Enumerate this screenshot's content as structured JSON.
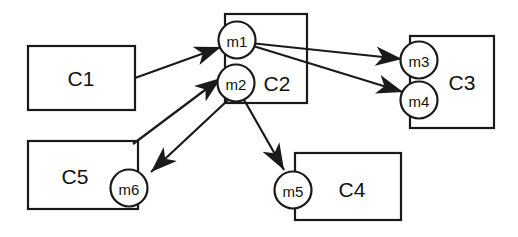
{
  "diagram": {
    "canvas": {
      "width": 518,
      "height": 237,
      "background": "#ffffff"
    },
    "style": {
      "line_color": "#1a1a1a",
      "fill_color": "#ffffff",
      "text_color": "#111111"
    },
    "components": [
      {
        "id": "C1",
        "label": "C1",
        "x": 28,
        "y": 46,
        "width": 107,
        "height": 64,
        "label_x": 81,
        "label_y": 78
      },
      {
        "id": "C2",
        "label": "C2",
        "x": 225,
        "y": 14,
        "width": 82,
        "height": 89,
        "label_x": 277,
        "label_y": 83
      },
      {
        "id": "C3",
        "label": "C3",
        "x": 410,
        "y": 36,
        "width": 84,
        "height": 92,
        "label_x": 462,
        "label_y": 82
      },
      {
        "id": "C4",
        "label": "C4",
        "x": 295,
        "y": 153,
        "width": 106,
        "height": 67,
        "label_x": 352,
        "label_y": 189
      },
      {
        "id": "C5",
        "label": "C5",
        "x": 28,
        "y": 141,
        "width": 110,
        "height": 68,
        "label_x": 75,
        "label_y": 176
      }
    ],
    "ports": [
      {
        "id": "m1",
        "label": "m1",
        "cx": 237,
        "cy": 40,
        "r": 18.5,
        "component": "C2"
      },
      {
        "id": "m2",
        "label": "m2",
        "cx": 236,
        "cy": 83,
        "r": 18.5,
        "component": "C2"
      },
      {
        "id": "m3",
        "label": "m3",
        "cx": 419,
        "cy": 60,
        "r": 18.5,
        "component": "C3"
      },
      {
        "id": "m4",
        "label": "m4",
        "cx": 419,
        "cy": 100,
        "r": 18.5,
        "component": "C4"
      },
      {
        "id": "m5",
        "label": "m5",
        "cx": 293,
        "cy": 190,
        "r": 18.5,
        "component": "C4"
      },
      {
        "id": "m6",
        "label": "m6",
        "cx": 129,
        "cy": 188,
        "r": 18.5,
        "component": "C5"
      }
    ],
    "connections": [
      {
        "id": "c1-to-m1",
        "from": "C1",
        "to": "m1",
        "x1": 135,
        "y1": 78,
        "x2": 221,
        "y2": 47,
        "arrow": "end"
      },
      {
        "id": "m1-to-m3",
        "from": "m1",
        "to": "m3",
        "x1": 250,
        "y1": 43,
        "x2": 402,
        "y2": 59,
        "arrow": "end"
      },
      {
        "id": "m1-to-m4",
        "from": "m1",
        "to": "m4",
        "x1": 250,
        "y1": 45,
        "x2": 403,
        "y2": 92,
        "arrow": "end"
      },
      {
        "id": "m2-to-m5",
        "from": "m2",
        "to": "m5",
        "x1": 243,
        "y1": 98,
        "x2": 284,
        "y2": 170,
        "arrow": "end"
      },
      {
        "id": "c5-to-m2",
        "from": "C5",
        "to": "m2",
        "x1": 133,
        "y1": 144,
        "x2": 221,
        "y2": 78,
        "arrow": "end"
      },
      {
        "id": "m2-to-m6",
        "from": "m2",
        "to": "m6",
        "x1": 228,
        "y1": 100,
        "x2": 151,
        "y2": 172,
        "arrow": "end"
      }
    ],
    "arrowhead": {
      "name": "filled-triangle-arrowhead",
      "length": 15,
      "width": 11
    }
  }
}
